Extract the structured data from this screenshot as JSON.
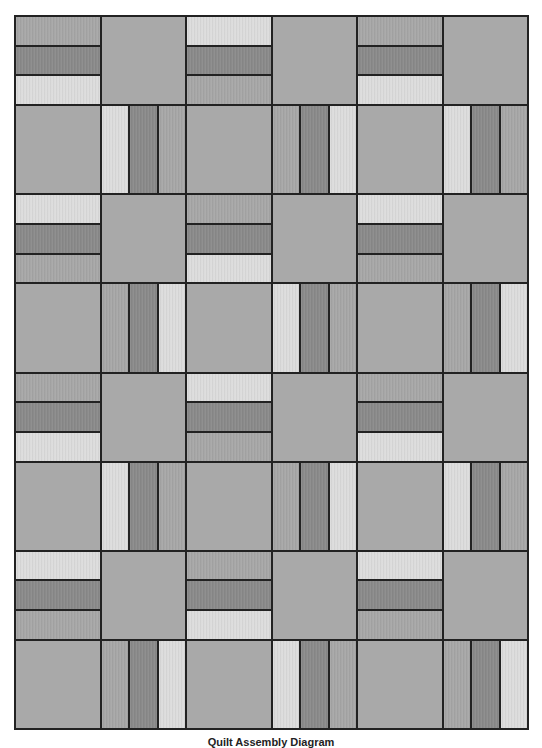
{
  "diagram": {
    "title": "Quilt Assembly Diagram",
    "grid": {
      "columns": 6,
      "rows": 8
    },
    "colors": {
      "light": "#dcdcdc",
      "medium": "#a7a7a7",
      "dark": "#8a8a8a",
      "plain": "#a9a9a9",
      "seam": "#222222"
    },
    "rows": [
      [
        {
          "type": "h",
          "strips": [
            "medium",
            "dark",
            "light"
          ]
        },
        {
          "type": "plain"
        },
        {
          "type": "h",
          "strips": [
            "light",
            "dark",
            "medium"
          ]
        },
        {
          "type": "plain"
        },
        {
          "type": "h",
          "strips": [
            "medium",
            "dark",
            "light"
          ]
        },
        {
          "type": "plain"
        }
      ],
      [
        {
          "type": "plain"
        },
        {
          "type": "v",
          "strips": [
            "light",
            "dark",
            "medium"
          ]
        },
        {
          "type": "plain"
        },
        {
          "type": "v",
          "strips": [
            "medium",
            "dark",
            "light"
          ]
        },
        {
          "type": "plain"
        },
        {
          "type": "v",
          "strips": [
            "light",
            "dark",
            "medium"
          ]
        }
      ],
      [
        {
          "type": "h",
          "strips": [
            "light",
            "dark",
            "medium"
          ]
        },
        {
          "type": "plain"
        },
        {
          "type": "h",
          "strips": [
            "medium",
            "dark",
            "light"
          ]
        },
        {
          "type": "plain"
        },
        {
          "type": "h",
          "strips": [
            "light",
            "dark",
            "medium"
          ]
        },
        {
          "type": "plain"
        }
      ],
      [
        {
          "type": "plain"
        },
        {
          "type": "v",
          "strips": [
            "medium",
            "dark",
            "light"
          ]
        },
        {
          "type": "plain"
        },
        {
          "type": "v",
          "strips": [
            "light",
            "dark",
            "medium"
          ]
        },
        {
          "type": "plain"
        },
        {
          "type": "v",
          "strips": [
            "medium",
            "dark",
            "light"
          ]
        }
      ],
      [
        {
          "type": "h",
          "strips": [
            "medium",
            "dark",
            "light"
          ]
        },
        {
          "type": "plain"
        },
        {
          "type": "h",
          "strips": [
            "light",
            "dark",
            "medium"
          ]
        },
        {
          "type": "plain"
        },
        {
          "type": "h",
          "strips": [
            "medium",
            "dark",
            "light"
          ]
        },
        {
          "type": "plain"
        }
      ],
      [
        {
          "type": "plain"
        },
        {
          "type": "v",
          "strips": [
            "light",
            "dark",
            "medium"
          ]
        },
        {
          "type": "plain"
        },
        {
          "type": "v",
          "strips": [
            "medium",
            "dark",
            "light"
          ]
        },
        {
          "type": "plain"
        },
        {
          "type": "v",
          "strips": [
            "light",
            "dark",
            "medium"
          ]
        }
      ],
      [
        {
          "type": "h",
          "strips": [
            "light",
            "dark",
            "medium"
          ]
        },
        {
          "type": "plain"
        },
        {
          "type": "h",
          "strips": [
            "medium",
            "dark",
            "light"
          ]
        },
        {
          "type": "plain"
        },
        {
          "type": "h",
          "strips": [
            "light",
            "dark",
            "medium"
          ]
        },
        {
          "type": "plain"
        }
      ],
      [
        {
          "type": "plain"
        },
        {
          "type": "v",
          "strips": [
            "medium",
            "dark",
            "light"
          ]
        },
        {
          "type": "plain"
        },
        {
          "type": "v",
          "strips": [
            "light",
            "dark",
            "medium"
          ]
        },
        {
          "type": "plain"
        },
        {
          "type": "v",
          "strips": [
            "medium",
            "dark",
            "light"
          ]
        }
      ]
    ]
  }
}
